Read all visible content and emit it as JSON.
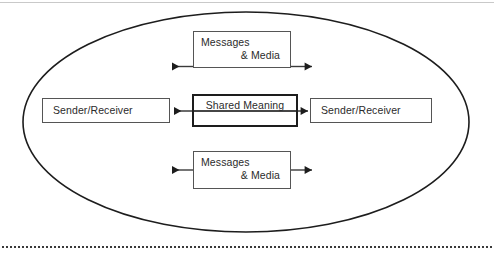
{
  "page": {
    "background_color": "#ffffff",
    "width": 494,
    "height": 256
  },
  "diagram": {
    "type": "communication-model",
    "container_shape": "ellipse",
    "container_label": "",
    "nodes": {
      "top_messages": {
        "line1": "Messages",
        "line2": "& Media",
        "border_color": "#555555",
        "border_width": 1
      },
      "bottom_messages": {
        "line1": "Messages",
        "line2": "& Media",
        "border_color": "#555555",
        "border_width": 1
      },
      "left_party": {
        "label": "Sender/Receiver",
        "border_color": "#555555",
        "border_width": 1
      },
      "right_party": {
        "label": "Sender/Receiver",
        "border_color": "#555555",
        "border_width": 1
      },
      "shared_meaning": {
        "label": "Shared Meaning",
        "border_color": "#1d1d1d",
        "border_width": 2
      }
    },
    "arrows": [
      {
        "name": "top-left-arrow",
        "direction": "left",
        "row": "top"
      },
      {
        "name": "top-right-arrow",
        "direction": "right",
        "row": "top"
      },
      {
        "name": "middle-left-arrow",
        "direction": "left",
        "row": "middle"
      },
      {
        "name": "middle-right-arrow",
        "direction": "right",
        "row": "middle"
      },
      {
        "name": "bottom-left-arrow",
        "direction": "left",
        "row": "bottom"
      },
      {
        "name": "bottom-right-arrow",
        "direction": "right",
        "row": "bottom"
      }
    ],
    "rules": {
      "top_rule_color": "#c9c9c9",
      "dotted_rule_color": "#3a3a3a"
    },
    "colors": {
      "stroke": "#1d1d1d",
      "text": "#2b2b2b",
      "thin_stroke": "#555555"
    }
  }
}
